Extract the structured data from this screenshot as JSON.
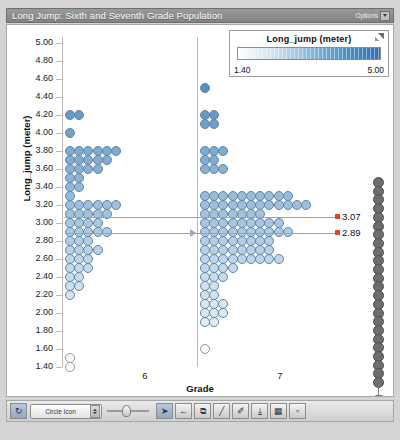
{
  "window": {
    "title": "Long Jump: Sixth and Seventh Grade Population",
    "options_label": "Options"
  },
  "legend": {
    "title": "Long_jump (meter)",
    "min": "1.40",
    "max": "5.00",
    "resize_icon": "resize-corner-icon"
  },
  "chart_data": {
    "type": "scatter",
    "title": "Long Jump: Sixth and Seventh Grade Population",
    "xlabel": "Grade",
    "ylabel": "Long_jump (meter)",
    "categories": [
      "6",
      "7"
    ],
    "ylim": [
      1.4,
      5.0
    ],
    "ytick_step": 0.2,
    "yticks": [
      "5.00",
      "4.80",
      "4.60",
      "4.40",
      "4.20",
      "4.00",
      "3.80",
      "3.60",
      "3.40",
      "3.20",
      "3.00",
      "2.80",
      "2.60",
      "2.40",
      "2.20",
      "2.00",
      "1.80",
      "1.60",
      "1.40"
    ],
    "grid": false,
    "legend_position": "top-right",
    "color_scale": {
      "field": "Long_jump (meter)",
      "min": 1.4,
      "max": 5.0,
      "low_color": "#ffffff",
      "high_color": "#2f72ad"
    },
    "annotations": [
      {
        "label": "3.07",
        "value": 3.07,
        "series": "grade-7-mean",
        "color": "#e2452c"
      },
      {
        "label": "2.89",
        "value": 2.89,
        "series": "grade-6-mean",
        "color": "#e2452c"
      }
    ],
    "series": [
      {
        "name": "6",
        "bins": [
          {
            "value": 4.2,
            "count": 2
          },
          {
            "value": 4.0,
            "count": 1
          },
          {
            "value": 3.8,
            "count": 6
          },
          {
            "value": 3.7,
            "count": 5
          },
          {
            "value": 3.6,
            "count": 4
          },
          {
            "value": 3.5,
            "count": 2
          },
          {
            "value": 3.4,
            "count": 2
          },
          {
            "value": 3.3,
            "count": 1
          },
          {
            "value": 3.2,
            "count": 6
          },
          {
            "value": 3.1,
            "count": 5
          },
          {
            "value": 3.0,
            "count": 4
          },
          {
            "value": 2.9,
            "count": 5
          },
          {
            "value": 2.8,
            "count": 3
          },
          {
            "value": 2.7,
            "count": 4
          },
          {
            "value": 2.6,
            "count": 3
          },
          {
            "value": 2.5,
            "count": 3
          },
          {
            "value": 2.4,
            "count": 2
          },
          {
            "value": 2.3,
            "count": 2
          },
          {
            "value": 2.2,
            "count": 1
          },
          {
            "value": 1.5,
            "count": 1
          },
          {
            "value": 1.4,
            "count": 1
          }
        ]
      },
      {
        "name": "7",
        "bins": [
          {
            "value": 4.5,
            "count": 1
          },
          {
            "value": 4.2,
            "count": 2
          },
          {
            "value": 4.1,
            "count": 2
          },
          {
            "value": 3.8,
            "count": 3
          },
          {
            "value": 3.7,
            "count": 2
          },
          {
            "value": 3.6,
            "count": 3
          },
          {
            "value": 3.3,
            "count": 10
          },
          {
            "value": 3.2,
            "count": 12
          },
          {
            "value": 3.1,
            "count": 7
          },
          {
            "value": 3.0,
            "count": 9
          },
          {
            "value": 2.9,
            "count": 10
          },
          {
            "value": 2.8,
            "count": 8
          },
          {
            "value": 2.7,
            "count": 8
          },
          {
            "value": 2.6,
            "count": 9
          },
          {
            "value": 2.5,
            "count": 4
          },
          {
            "value": 2.4,
            "count": 3
          },
          {
            "value": 2.3,
            "count": 2
          },
          {
            "value": 2.2,
            "count": 2
          },
          {
            "value": 2.1,
            "count": 3
          },
          {
            "value": 2.0,
            "count": 3
          },
          {
            "value": 1.9,
            "count": 2
          },
          {
            "value": 1.6,
            "count": 1
          }
        ]
      }
    ]
  },
  "toolbar": {
    "refresh_icon": "refresh-icon",
    "icon_select_value": "Circle Icon",
    "slider_name": "size-slider",
    "buttons": [
      {
        "name": "pointer-tool",
        "glyph": "➤",
        "active": true
      },
      {
        "name": "pan-tool",
        "glyph": "←"
      },
      {
        "name": "link-tool",
        "glyph": "⧉"
      },
      {
        "name": "pencil-tool",
        "glyph": "╱"
      },
      {
        "name": "brush-tool",
        "glyph": "✐"
      },
      {
        "name": "download-tool",
        "glyph": "⤓"
      },
      {
        "name": "table-tool",
        "glyph": "▦"
      },
      {
        "name": "note-tool",
        "glyph": "▫"
      }
    ]
  }
}
